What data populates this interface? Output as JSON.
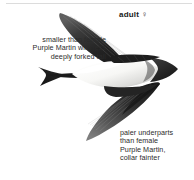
{
  "plate": {
    "divider": "horizontal-rule",
    "subject": "swift-in-flight-illustration",
    "age_label": "adult ♀",
    "notes": {
      "left": "smaller than female\nPurple Martin with less\ndeeply forked tail",
      "right": "paler underparts\nthan female\nPurple Martin,\ncollar fainter"
    }
  },
  "colors": {
    "background": "#ffffff",
    "rule": "#dcdcdc",
    "text": "#2b2b2b",
    "label_text": "#1a1a1a",
    "plumage_dark": "#262626",
    "plumage_mid": "#6d6d6d",
    "plumage_light": "#f2f2f0"
  }
}
